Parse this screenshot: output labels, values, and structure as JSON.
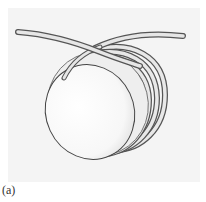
{
  "figure": {
    "caption": "(a)",
    "colors": {
      "panel_background": "#f4f4f4",
      "cylinder_face": "#ffffff",
      "cylinder_shade": "#dcdcdc",
      "rope_fill": "#e6e6e6",
      "rope_outline": "#555555"
    },
    "rope_turns": 3
  }
}
